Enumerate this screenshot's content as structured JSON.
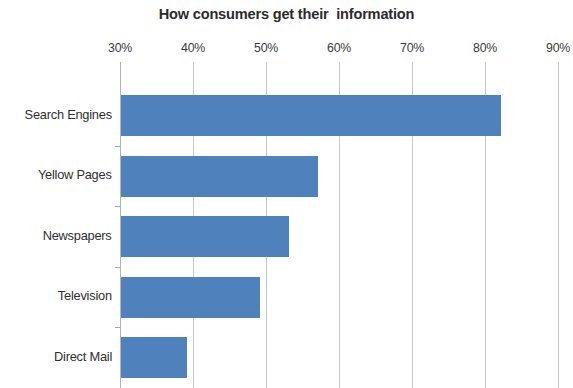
{
  "chart_data": {
    "type": "bar",
    "orientation": "horizontal",
    "title": "How consumers get their  information",
    "xlabel": "",
    "ylabel": "",
    "categories": [
      "Search Engines",
      "Yellow Pages",
      "Newspapers",
      "Television",
      "Direct Mail"
    ],
    "values": [
      82,
      57,
      53,
      49,
      39
    ],
    "value_format": "percent",
    "xlim": [
      30,
      90
    ],
    "xticks": [
      30,
      40,
      50,
      60,
      70,
      80,
      90
    ],
    "xtick_labels": [
      "30%",
      "40%",
      "50%",
      "60%",
      "70%",
      "80%",
      "90%"
    ],
    "axis_position": "top",
    "grid": true,
    "grid_axis": "x",
    "legend": false,
    "series": [
      {
        "name": "Share of consumers",
        "color": "#4F81BD",
        "values": [
          82,
          57,
          53,
          49,
          39
        ]
      }
    ],
    "colors": {
      "bar": "#4F81BD",
      "gridline": "#C8C8C8",
      "axis": "#B4B4B4",
      "title_text": "#2B2B2B",
      "tick_text": "#3A3A3A",
      "category_text": "#2F2F2F",
      "background": "#FFFFFF"
    },
    "note": "Bottom bar is clipped by the image frame"
  }
}
